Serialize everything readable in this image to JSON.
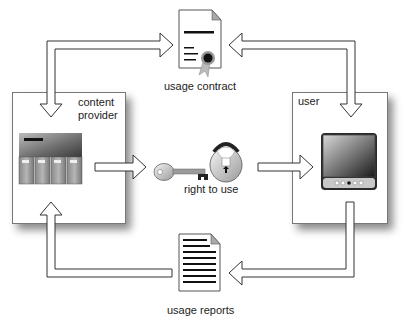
{
  "diagram": {
    "nodes": {
      "content_provider": {
        "label_line1": "content",
        "label_line2": "provider"
      },
      "user": {
        "label": "user"
      },
      "usage_contract": {
        "label": "usage contract",
        "icon": "document-certificate-icon"
      },
      "right_to_use": {
        "label": "right to use",
        "icon": "key-and-padlock-icon"
      },
      "usage_reports": {
        "label": "usage reports",
        "icon": "report-document-icon"
      }
    },
    "edges": [
      {
        "from": "content_provider",
        "to": "usage_contract",
        "style": "bidirectional-hollow-arrow"
      },
      {
        "from": "user",
        "to": "usage_contract",
        "style": "bidirectional-hollow-arrow"
      },
      {
        "from": "content_provider",
        "to": "right_to_use",
        "style": "hollow-arrow"
      },
      {
        "from": "right_to_use",
        "to": "user",
        "style": "hollow-arrow"
      },
      {
        "from": "user",
        "to": "usage_reports",
        "style": "hollow-arrow"
      },
      {
        "from": "usage_reports",
        "to": "content_provider",
        "style": "hollow-arrow"
      }
    ],
    "colors": {
      "line": "#333333",
      "arrow_fill": "#ffffff",
      "box_border": "#777777"
    }
  }
}
